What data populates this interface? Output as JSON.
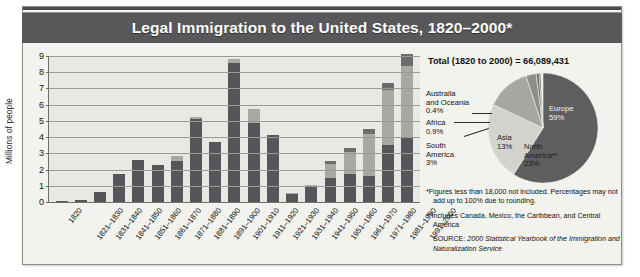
{
  "title": "Legal Immigration to the United States, 1820–2000*",
  "chart_data": {
    "type": "bar",
    "title": "Legal Immigration to the United States, 1820–2000*",
    "xlabel": "",
    "ylabel": "Millions of people",
    "ylim": [
      0,
      9
    ],
    "yticks": [
      0,
      1,
      2,
      3,
      4,
      5,
      6,
      7,
      8,
      9
    ],
    "grid": true,
    "legend": "none",
    "stacked": true,
    "categories": [
      "1820",
      "1821–1830",
      "1831–1840",
      "1841–1850",
      "1851–1860",
      "1861–1870",
      "1871–1880",
      "1881–1890",
      "1891–1900",
      "1901–1910",
      "1911–1920",
      "1921–1930",
      "1931–1940",
      "1941–1950",
      "1951–1960",
      "1961–1970",
      "1971–1980",
      "1981–1990",
      "1991–2000"
    ],
    "values": [
      0.01,
      0.14,
      0.6,
      1.71,
      2.6,
      2.31,
      2.81,
      5.25,
      3.69,
      8.8,
      5.74,
      4.11,
      0.53,
      1.04,
      2.52,
      3.32,
      4.49,
      7.34,
      9.1
    ],
    "series": [
      {
        "name": "lower-segment",
        "values": [
          0.01,
          0.14,
          0.6,
          1.71,
          2.6,
          2.31,
          2.5,
          5.1,
          3.69,
          8.6,
          4.9,
          4.11,
          0.5,
          0.9,
          1.5,
          1.7,
          1.6,
          3.5,
          4.0
        ]
      },
      {
        "name": "middle-segment",
        "values": [
          0,
          0,
          0,
          0,
          0,
          0,
          0.31,
          0.15,
          0,
          0.2,
          0.84,
          0,
          0.03,
          0.14,
          0.85,
          1.4,
          2.6,
          3.4,
          4.4
        ]
      },
      {
        "name": "upper-segment",
        "values": [
          0,
          0,
          0,
          0,
          0,
          0,
          0,
          0,
          0,
          0,
          0,
          0,
          0,
          0,
          0.17,
          0.22,
          0.29,
          0.44,
          0.7
        ]
      }
    ]
  },
  "pie": {
    "type": "pie",
    "total_label": "Total (1820 to 2000) = 66,089,431",
    "slices": [
      {
        "label": "Europe",
        "value_label": "59%",
        "value": 59,
        "color": "#5e5e60"
      },
      {
        "label": "North America**",
        "value_label": "23%",
        "value": 23,
        "color": "#d3d3cd"
      },
      {
        "label": "Asia",
        "value_label": "13%",
        "value": 13,
        "color": "#a7a7a1"
      },
      {
        "label": "South America",
        "value_label": "3%",
        "value": 3,
        "color": "#8e8e88"
      },
      {
        "label": "Africa",
        "value_label": "0.9%",
        "value": 0.9,
        "color": "#6f6f70"
      },
      {
        "label": "Australia and Oceania",
        "value_label": "0.4%",
        "value": 0.4,
        "color": "#454547"
      }
    ],
    "labels": {
      "australia_l1": "Australia",
      "australia_l2": "and Oceania",
      "australia_pct": "0.4%",
      "africa": "Africa",
      "africa_pct": "0.9%",
      "south_america_l1": "South",
      "south_america_l2": "America",
      "south_america_pct": "3%",
      "asia": "Asia",
      "asia_pct": "13%",
      "north_america_l1": "North",
      "north_america_l2": "America**",
      "north_america_pct": "23%",
      "europe": "Europe",
      "europe_pct": "59%"
    }
  },
  "notes": {
    "footnote1": "*Figures less than 18,000 not included. Percentages may not add up to 100% due to rounding.",
    "footnote2": "**Includes Canada, Mexico, the Caribbean, and Central America",
    "source_prefix": "SOURCE: ",
    "source_text": "2000 Statistical Yearbook of the Immigration and Naturalization Service"
  },
  "colors": {
    "title_bar": "#58585a",
    "card_bg": "#f2f2ef",
    "plot_bg": "#e8e8e4",
    "segment_dark": "#56565a",
    "segment_light": "#a9a9a4",
    "segment_mid": "#6d6d70"
  }
}
